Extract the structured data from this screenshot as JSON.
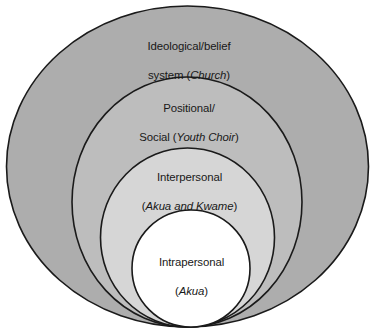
{
  "diagram": {
    "type": "nested-ellipses",
    "background_color": "#ffffff",
    "stroke_color": "#1a1a1a",
    "rings": [
      {
        "id": "ideological",
        "level": 1,
        "position": "outermost",
        "fill_color": "#adadad",
        "label_line1": "Ideological/belief",
        "label_line2_prefix": "system (",
        "label_italic": "Church",
        "label_line2_suffix": ")",
        "label_plain": "Ideological/belief system (Church)"
      },
      {
        "id": "positional-social",
        "level": 2,
        "position": "second",
        "fill_color": "#bdbdbd",
        "label_line1": "Positional/",
        "label_line2_prefix": "Social (",
        "label_italic": "Youth Choir",
        "label_line2_suffix": ")",
        "label_plain": "Positional/ Social (Youth Choir)"
      },
      {
        "id": "interpersonal",
        "level": 3,
        "position": "third",
        "fill_color": "#d6d6d6",
        "label_line1": "Interpersonal",
        "label_line2_prefix": "(",
        "label_italic": "Akua and Kwame",
        "label_line2_suffix": ")",
        "label_plain": "Interpersonal (Akua and Kwame)"
      },
      {
        "id": "intrapersonal",
        "level": 4,
        "position": "innermost",
        "fill_color": "#ffffff",
        "label_line1": "Intrapersonal",
        "label_line2_prefix": "(",
        "label_italic": "Akua",
        "label_line2_suffix": ")",
        "label_plain": "Intrapersonal (Akua)"
      }
    ]
  }
}
